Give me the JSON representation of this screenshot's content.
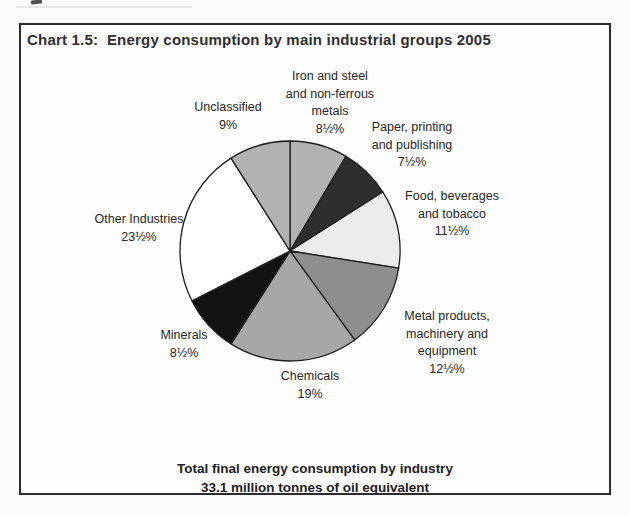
{
  "chart": {
    "title": "Chart 1.5:  Energy consumption by main industrial groups 2005",
    "labels": {
      "iron": "Iron and steel\nand non-ferrous\nmetals\n8½%",
      "unclassified": "Unclassified\n9%",
      "paper": "Paper, printing\nand publishing\n7½%",
      "food": "Food, beverages\nand tobacco\n11½%",
      "metal": "Metal products,\nmachinery and\nequipment\n12½%",
      "chemicals": "Chemicals\n19%",
      "minerals": "Minerals\n8½%",
      "other": "Other Industries\n23½%"
    },
    "footer_line1": "Total final energy consumption by industry",
    "footer_line2": "33.1 million tonnes of oil equivalent"
  },
  "chart_data": {
    "type": "pie",
    "title": "Chart 1.5: Energy consumption by main industrial groups 2005",
    "total_note": "Total final energy consumption by industry: 33.1 million tonnes of oil equivalent",
    "start_angle_deg": 0,
    "direction": "clockwise",
    "slices": [
      {
        "id": "iron",
        "category": "Iron and steel and non-ferrous metals",
        "value": 8.5,
        "display": "8½%",
        "color": "#b2b2b2"
      },
      {
        "id": "paper",
        "category": "Paper, printing and publishing",
        "value": 7.5,
        "display": "7½%",
        "color": "#2e2e2e"
      },
      {
        "id": "food",
        "category": "Food, beverages and tobacco",
        "value": 11.5,
        "display": "11½%",
        "color": "#ebebeb"
      },
      {
        "id": "metal",
        "category": "Metal products, machinery and equipment",
        "value": 12.5,
        "display": "12½%",
        "color": "#8e8e8e"
      },
      {
        "id": "chemicals",
        "category": "Chemicals",
        "value": 19,
        "display": "19%",
        "color": "#a7a7a7"
      },
      {
        "id": "minerals",
        "category": "Minerals",
        "value": 8.5,
        "display": "8½%",
        "color": "#121212"
      },
      {
        "id": "other",
        "category": "Other Industries",
        "value": 23.5,
        "display": "23½%",
        "color": "#ffffff"
      },
      {
        "id": "unclassified",
        "category": "Unclassified",
        "value": 9,
        "display": "9%",
        "color": "#b2b2b2"
      }
    ],
    "stroke_color": "#1f1f1f"
  }
}
